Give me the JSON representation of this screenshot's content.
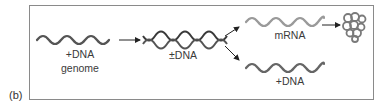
{
  "panel": {
    "label": "(b)"
  },
  "nodes": {
    "genome": {
      "line1": "+DNA",
      "line2": "genome",
      "strand": "single",
      "color": "#555555"
    },
    "ds_dna": {
      "label": "±DNA",
      "strand": "double",
      "color": "#3a3a3a"
    },
    "mrna": {
      "label": "mRNA",
      "strand": "single",
      "color": "#9a9a9a"
    },
    "new_dna": {
      "label": "+DNA",
      "strand": "single",
      "color": "#666666"
    },
    "protein": {
      "label": "",
      "shape": "folded-chain",
      "color": "#8a8a8a"
    }
  },
  "edges": [
    {
      "from": "genome",
      "to": "ds_dna"
    },
    {
      "from": "ds_dna",
      "to": "mrna"
    },
    {
      "from": "ds_dna",
      "to": "new_dna"
    },
    {
      "from": "mrna",
      "to": "protein"
    }
  ],
  "colors": {
    "frame": "#8a8a8a",
    "arrow": "#222222",
    "text": "#3a3a3a"
  }
}
